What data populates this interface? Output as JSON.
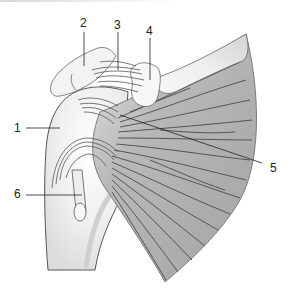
{
  "diagram": {
    "labels": [
      {
        "id": "1",
        "text": "1"
      },
      {
        "id": "2",
        "text": "2"
      },
      {
        "id": "3",
        "text": "3"
      },
      {
        "id": "4",
        "text": "4"
      },
      {
        "id": "5",
        "text": "5"
      },
      {
        "id": "6",
        "text": "6"
      }
    ],
    "colors": {
      "bone": "#f2f2f2",
      "bone_outline": "#555555",
      "muscle": "#a9a9a9",
      "muscle_fiber": "#4a4a4a",
      "leader_line": "#222222"
    }
  }
}
